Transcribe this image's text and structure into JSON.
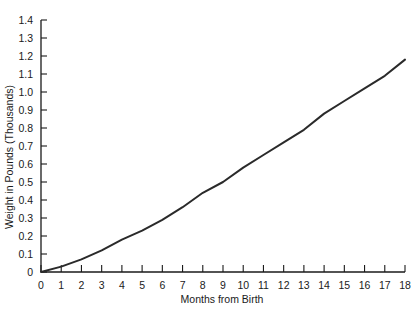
{
  "chart_data": {
    "type": "line",
    "title": "",
    "xlabel": "Months from Birth",
    "ylabel": "Weight in Pounds (Thousands)",
    "xlim": [
      0,
      18
    ],
    "ylim": [
      0,
      1.4
    ],
    "x_ticks": [
      0,
      1,
      2,
      3,
      4,
      5,
      6,
      7,
      8,
      9,
      10,
      11,
      12,
      13,
      14,
      15,
      16,
      17,
      18
    ],
    "y_ticks": [
      0,
      0.1,
      0.2,
      0.3,
      0.4,
      0.5,
      0.6,
      0.7,
      0.8,
      0.9,
      1.0,
      1.1,
      1.2,
      1.3,
      1.4
    ],
    "y_tick_labels": [
      "0",
      "0.1",
      "0.2",
      "0.3",
      "0.4",
      "0.5",
      "0.6",
      "0.7",
      "0.8",
      "0.9",
      "1.0",
      "1.1",
      "1.2",
      "1.3",
      "1.4"
    ],
    "grid": false,
    "legend": null,
    "series": [
      {
        "name": "Weight",
        "color": "#2a2a2a",
        "x": [
          0,
          1,
          2,
          3,
          4,
          5,
          6,
          7,
          8,
          9,
          10,
          11,
          12,
          13,
          14,
          15,
          16,
          17,
          18
        ],
        "values": [
          0,
          0.03,
          0.07,
          0.12,
          0.18,
          0.23,
          0.29,
          0.36,
          0.44,
          0.5,
          0.58,
          0.65,
          0.72,
          0.79,
          0.88,
          0.95,
          1.02,
          1.09,
          1.18
        ]
      }
    ]
  },
  "colors": {
    "axis": "#1a1a1a",
    "line": "#2a2a2a",
    "background": "#ffffff"
  }
}
